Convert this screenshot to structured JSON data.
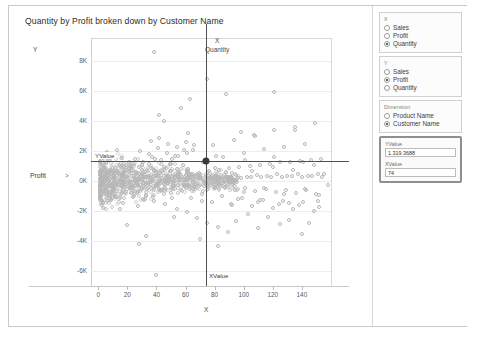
{
  "chart_data": {
    "type": "scatter",
    "title": "Quantity by Profit broken down by Customer Name",
    "xlabel": "X",
    "ylabel": "Y",
    "x_field": "Quantity",
    "y_field": "Profit",
    "dimension": "Customer Name",
    "xlim": [
      -5,
      160
    ],
    "ylim": [
      -7000,
      9500
    ],
    "xticks": [
      0,
      20,
      40,
      60,
      80,
      100,
      120,
      140
    ],
    "xticklabels": [
      "0",
      "20",
      "40",
      "60",
      "80",
      "100",
      "120",
      "140"
    ],
    "yticks": [
      8000,
      6000,
      4000,
      2000,
      0,
      -2000,
      -4000,
      -6000
    ],
    "yticklabels": [
      "8K",
      "6K",
      "4K",
      "2K",
      "0K",
      "-2K",
      "-4K",
      "-6K"
    ],
    "grid": true,
    "legend": "none",
    "reference_lines": {
      "x_label": "XValue",
      "y_label": "YValue",
      "x": 74,
      "y": 1319.3688
    },
    "marker": {
      "shape": "circle-open",
      "color": "#b6b6b6",
      "size": 4
    },
    "highlight_point": {
      "x": 74,
      "y": 1319.3688,
      "color": "#3a3a3a"
    },
    "points": [
      [
        2,
        120
      ],
      [
        3,
        -85
      ],
      [
        4,
        260
      ],
      [
        5,
        -430
      ],
      [
        6,
        95
      ],
      [
        7,
        310
      ],
      [
        8,
        -150
      ],
      [
        9,
        480
      ],
      [
        10,
        -620
      ],
      [
        11,
        210
      ],
      [
        12,
        -40
      ],
      [
        13,
        640
      ],
      [
        14,
        -310
      ],
      [
        15,
        150
      ],
      [
        16,
        -780
      ],
      [
        17,
        420
      ],
      [
        18,
        -95
      ],
      [
        19,
        260
      ],
      [
        20,
        -520
      ],
      [
        21,
        880
      ],
      [
        22,
        -210
      ],
      [
        23,
        330
      ],
      [
        24,
        -1050
      ],
      [
        25,
        190
      ],
      [
        26,
        560
      ],
      [
        27,
        -340
      ],
      [
        28,
        120
      ],
      [
        29,
        -690
      ],
      [
        30,
        740
      ],
      [
        31,
        -180
      ],
      [
        32,
        410
      ],
      [
        33,
        -920
      ],
      [
        34,
        250
      ],
      [
        35,
        1120
      ],
      [
        36,
        -460
      ],
      [
        37,
        80
      ],
      [
        38,
        -1340
      ],
      [
        39,
        620
      ],
      [
        40,
        -260
      ],
      [
        41,
        350
      ],
      [
        42,
        4400
      ],
      [
        43,
        -580
      ],
      [
        44,
        200
      ],
      [
        45,
        910
      ],
      [
        46,
        -1560
      ],
      [
        47,
        300
      ],
      [
        48,
        -120
      ],
      [
        49,
        680
      ],
      [
        50,
        -800
      ],
      [
        51,
        1480
      ],
      [
        52,
        -350
      ],
      [
        53,
        240
      ],
      [
        54,
        -1880
      ],
      [
        55,
        470
      ],
      [
        56,
        130
      ],
      [
        57,
        -640
      ],
      [
        58,
        1050
      ],
      [
        59,
        -290
      ],
      [
        60,
        380
      ],
      [
        61,
        -2100
      ],
      [
        62,
        760
      ],
      [
        63,
        190
      ],
      [
        64,
        -1150
      ],
      [
        65,
        2050
      ],
      [
        66,
        -430
      ],
      [
        67,
        290
      ],
      [
        68,
        -2450
      ],
      [
        69,
        540
      ],
      [
        70,
        160
      ],
      [
        71,
        -870
      ],
      [
        72,
        1280
      ],
      [
        73,
        -330
      ],
      [
        74,
        1319
      ],
      [
        75,
        -2800
      ],
      [
        76,
        620
      ],
      [
        77,
        220
      ],
      [
        78,
        -1380
      ],
      [
        79,
        2380
      ],
      [
        80,
        -510
      ],
      [
        81,
        330
      ],
      [
        82,
        -3100
      ],
      [
        83,
        700
      ],
      [
        84,
        180
      ],
      [
        85,
        -1020
      ],
      [
        86,
        1560
      ],
      [
        87,
        -390
      ],
      [
        88,
        260
      ],
      [
        89,
        -3400
      ],
      [
        90,
        820
      ],
      [
        91,
        240
      ],
      [
        92,
        -1580
      ],
      [
        93,
        2700
      ],
      [
        94,
        -590
      ],
      [
        95,
        360
      ],
      [
        96,
        -1240
      ],
      [
        97,
        900
      ],
      [
        98,
        200
      ],
      [
        99,
        -1120
      ],
      [
        100,
        1820
      ],
      [
        101,
        -450
      ],
      [
        102,
        280
      ],
      [
        103,
        -2200
      ],
      [
        104,
        980
      ],
      [
        105,
        260
      ],
      [
        106,
        -1680
      ],
      [
        107,
        3050
      ],
      [
        108,
        -680
      ],
      [
        109,
        400
      ],
      [
        110,
        -1420
      ],
      [
        111,
        1080
      ],
      [
        112,
        220
      ],
      [
        113,
        -1260
      ],
      [
        114,
        2100
      ],
      [
        115,
        -520
      ],
      [
        116,
        300
      ],
      [
        117,
        -2400
      ],
      [
        118,
        1150
      ],
      [
        119,
        280
      ],
      [
        120,
        -1780
      ],
      [
        121,
        3380
      ],
      [
        122,
        -760
      ],
      [
        123,
        430
      ],
      [
        124,
        -1520
      ],
      [
        125,
        1220
      ],
      [
        126,
        240
      ],
      [
        127,
        -1360
      ],
      [
        128,
        2280
      ],
      [
        129,
        -580
      ],
      [
        130,
        320
      ],
      [
        131,
        -2600
      ],
      [
        132,
        1280
      ],
      [
        133,
        300
      ],
      [
        134,
        -1880
      ],
      [
        135,
        3600
      ],
      [
        136,
        -820
      ],
      [
        137,
        460
      ],
      [
        138,
        -1620
      ],
      [
        139,
        1340
      ],
      [
        140,
        260
      ],
      [
        141,
        -1440
      ],
      [
        142,
        2420
      ],
      [
        143,
        -620
      ],
      [
        144,
        340
      ],
      [
        145,
        -2780
      ],
      [
        146,
        1380
      ],
      [
        147,
        320
      ],
      [
        148,
        -1980
      ],
      [
        149,
        3820
      ],
      [
        150,
        -880
      ],
      [
        151,
        480
      ],
      [
        152,
        -1720
      ],
      [
        153,
        1420
      ],
      [
        154,
        280
      ],
      [
        38,
        8600
      ],
      [
        75,
        6750
      ],
      [
        88,
        5800
      ],
      [
        121,
        5900
      ],
      [
        63,
        5450
      ],
      [
        57,
        4850
      ],
      [
        45,
        3950
      ],
      [
        62,
        3150
      ],
      [
        98,
        3250
      ],
      [
        135,
        3350
      ],
      [
        108,
        2950
      ],
      [
        40,
        -6300
      ],
      [
        28,
        -4200
      ],
      [
        33,
        -3650
      ],
      [
        20,
        -2950
      ],
      [
        52,
        -2380
      ],
      [
        15,
        -1850
      ],
      [
        70,
        -3850
      ],
      [
        82,
        -4350
      ],
      [
        95,
        -2650
      ],
      [
        110,
        -3150
      ],
      [
        125,
        -2850
      ],
      [
        140,
        -3550
      ],
      [
        36,
        2650
      ],
      [
        42,
        2850
      ],
      [
        48,
        2450
      ],
      [
        54,
        2250
      ],
      [
        60,
        2550
      ],
      [
        66,
        2350
      ],
      [
        29,
        1950
      ],
      [
        35,
        1750
      ],
      [
        41,
        2150
      ],
      [
        47,
        1850
      ],
      [
        53,
        1650
      ],
      [
        59,
        2050
      ],
      [
        25,
        1450
      ],
      [
        31,
        1250
      ],
      [
        37,
        1550
      ],
      [
        43,
        1350
      ],
      [
        49,
        1150
      ],
      [
        55,
        1650
      ],
      [
        18,
        950
      ],
      [
        24,
        750
      ],
      [
        30,
        1050
      ],
      [
        36,
        850
      ],
      [
        44,
        650
      ],
      [
        50,
        1150
      ],
      [
        12,
        550
      ],
      [
        16,
        350
      ],
      [
        22,
        650
      ],
      [
        26,
        450
      ],
      [
        32,
        250
      ],
      [
        38,
        750
      ],
      [
        8,
        150
      ],
      [
        14,
        -50
      ],
      [
        20,
        250
      ],
      [
        28,
        50
      ],
      [
        34,
        -150
      ],
      [
        40,
        350
      ],
      [
        6,
        -250
      ],
      [
        10,
        -450
      ],
      [
        18,
        -150
      ],
      [
        24,
        -350
      ],
      [
        30,
        -550
      ],
      [
        46,
        -250
      ],
      [
        64,
        450
      ],
      [
        72,
        -650
      ],
      [
        80,
        850
      ],
      [
        86,
        -350
      ],
      [
        92,
        550
      ],
      [
        100,
        -750
      ],
      [
        106,
        650
      ],
      [
        114,
        -450
      ],
      [
        120,
        950
      ],
      [
        128,
        -850
      ],
      [
        134,
        750
      ],
      [
        142,
        -550
      ],
      [
        148,
        1050
      ],
      [
        152,
        -950
      ],
      [
        155,
        450
      ],
      [
        158,
        -250
      ],
      [
        5,
        1850
      ],
      [
        9,
        -1250
      ],
      [
        13,
        2050
      ],
      [
        17,
        -1450
      ],
      [
        21,
        1250
      ],
      [
        27,
        -1650
      ],
      [
        39,
        1450
      ],
      [
        51,
        -1150
      ],
      [
        61,
        1850
      ],
      [
        71,
        -1350
      ],
      [
        81,
        1650
      ],
      [
        91,
        -1550
      ],
      [
        101,
        1350
      ],
      [
        111,
        -1250
      ],
      [
        121,
        1550
      ],
      [
        131,
        -1450
      ],
      [
        141,
        1250
      ],
      [
        151,
        -1350
      ]
    ]
  },
  "controls": {
    "x_group": {
      "legend": "X",
      "options": [
        {
          "label": "Sales",
          "checked": false
        },
        {
          "label": "Profit",
          "checked": false
        },
        {
          "label": "Quantity",
          "checked": true
        }
      ]
    },
    "y_group": {
      "legend": "Y",
      "options": [
        {
          "label": "Sales",
          "checked": false
        },
        {
          "label": "Profit",
          "checked": true
        },
        {
          "label": "Quantity",
          "checked": false
        }
      ]
    },
    "dimension_group": {
      "legend": "Dimension",
      "options": [
        {
          "label": "Product Name",
          "checked": false
        },
        {
          "label": "Customer Name",
          "checked": true
        }
      ]
    },
    "value_fields": {
      "yvalue": {
        "label": "YValue",
        "value": "1.319.3688"
      },
      "xvalue": {
        "label": "XValue",
        "value": "74"
      }
    }
  }
}
